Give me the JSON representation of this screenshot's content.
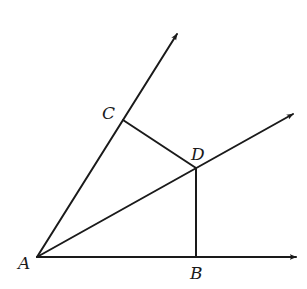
{
  "diagram": {
    "type": "geometry",
    "stroke_color": "#1a1a1a",
    "points": {
      "A": {
        "label": "A",
        "x": 37,
        "y": 257
      },
      "B": {
        "label": "B",
        "x": 196,
        "y": 257
      },
      "C": {
        "label": "C",
        "x": 123,
        "y": 120
      },
      "D": {
        "label": "D",
        "x": 196,
        "y": 168
      }
    },
    "rays": [
      {
        "name": "ray-AC",
        "from": "A",
        "through": "C",
        "tip": {
          "x": 177,
          "y": 34
        }
      },
      {
        "name": "ray-AD",
        "from": "A",
        "through": "D",
        "tip": {
          "x": 293,
          "y": 114
        }
      },
      {
        "name": "ray-AB",
        "from": "A",
        "through": "B",
        "tip": {
          "x": 296,
          "y": 257
        }
      }
    ],
    "segments": [
      {
        "name": "segment-CD",
        "from": "C",
        "to": "D"
      },
      {
        "name": "segment-DB",
        "from": "D",
        "to": "B"
      }
    ],
    "labels": {
      "A": "A",
      "B": "B",
      "C": "C",
      "D": "D"
    }
  }
}
